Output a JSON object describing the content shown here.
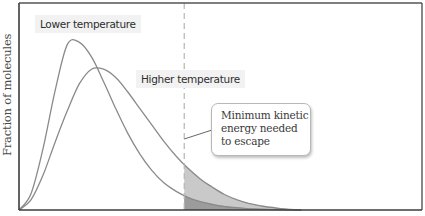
{
  "chart_data": {
    "type": "line",
    "title": "",
    "xlabel": "",
    "ylabel": "Fraction of molecules",
    "x_ticks": [],
    "y_ticks": [],
    "grid": false,
    "legend": "inline labels",
    "frame": {
      "left": 19,
      "top": 3,
      "right": 422,
      "bottom": 210
    },
    "x_range": [
      0,
      100
    ],
    "y_range": [
      0,
      100
    ],
    "series": [
      {
        "name": "Lower temperature",
        "color": "#8a8a8a",
        "x": [
          0,
          3,
          6,
          9,
          12,
          15,
          18,
          21,
          24,
          27,
          30,
          33,
          36,
          39,
          42,
          45,
          48,
          51,
          54,
          57,
          60,
          63,
          66,
          70
        ],
        "y": [
          0,
          8,
          30,
          58,
          80,
          81,
          74,
          62,
          49,
          37,
          27,
          19,
          13,
          9,
          6,
          4,
          2.7,
          1.7,
          1.1,
          0.7,
          0.4,
          0.2,
          0.1,
          0
        ]
      },
      {
        "name": "Higher temperature",
        "color": "#8a8a8a",
        "x": [
          0,
          3,
          6,
          9,
          12,
          15,
          18,
          21,
          24,
          27,
          30,
          33,
          36,
          39,
          42,
          45,
          48,
          51,
          54,
          57,
          60,
          65,
          70
        ],
        "y": [
          0,
          5,
          17,
          33,
          48,
          61,
          68,
          68,
          64,
          57,
          49,
          41,
          33,
          26,
          20,
          15,
          11,
          7.5,
          5,
          3.2,
          2,
          0.7,
          0
        ]
      }
    ],
    "threshold": {
      "x": 41,
      "style": "dashed",
      "label": "Minimum kinetic energy needed to escape"
    },
    "shaded_region": {
      "series": "Lower temperature",
      "from_x": 41,
      "to_x": 70,
      "note": "area under higher-temperature curve beyond threshold, light grey"
    },
    "annotations": [
      {
        "text": "Lower temperature",
        "near_series": "Lower temperature"
      },
      {
        "text": "Higher temperature",
        "near_series": "Higher temperature"
      },
      {
        "text": "Minimum kinetic energy needed to escape",
        "type": "callout"
      }
    ]
  },
  "labels": {
    "y_axis": "Fraction of molecules",
    "lower": "Lower temperature",
    "higher": "Higher temperature",
    "callout_lines": [
      "Minimum kinetic",
      "energy needed",
      "to escape"
    ]
  },
  "colors": {
    "frame": "#555555",
    "curve": "#8a8a8a",
    "dashed": "#b5b5b5",
    "shade_light": "#c9c9c9",
    "shade_dark": "#9c9c9c"
  }
}
